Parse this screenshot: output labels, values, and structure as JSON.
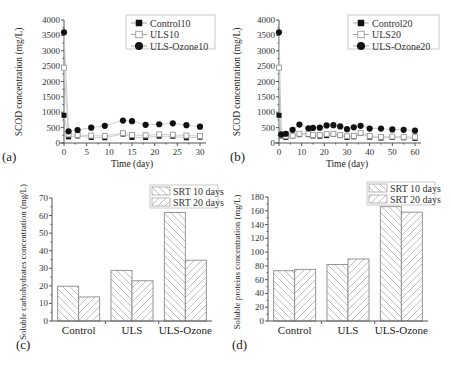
{
  "chart_data": [
    {
      "id": "a",
      "type": "line",
      "panel_label": "(a)",
      "title": "",
      "xlabel": "Time (day)",
      "ylabel": "SCOD concentration (mg/L)",
      "xlim": [
        0,
        30
      ],
      "ylim": [
        0,
        4000
      ],
      "xticks": [
        0,
        5,
        10,
        15,
        20,
        25,
        30
      ],
      "yticks": [
        0,
        500,
        1000,
        1500,
        2000,
        2500,
        3000,
        3500,
        4000
      ],
      "grid": false,
      "legend_position": "upper right",
      "x": [
        0,
        1,
        3,
        6,
        9,
        13,
        15,
        18,
        21,
        24,
        27,
        30
      ],
      "series": [
        {
          "name": "Control10",
          "marker": "filled-square",
          "values": [
            900,
            200,
            230,
            180,
            170,
            290,
            180,
            180,
            220,
            220,
            170,
            190
          ]
        },
        {
          "name": "ULS10",
          "marker": "open-square",
          "values": [
            2450,
            280,
            260,
            240,
            230,
            320,
            260,
            250,
            280,
            270,
            240,
            230
          ]
        },
        {
          "name": "ULS-Ozone10",
          "marker": "filled-circle",
          "values": [
            3600,
            380,
            420,
            500,
            560,
            730,
            710,
            590,
            610,
            640,
            580,
            530
          ]
        }
      ]
    },
    {
      "id": "b",
      "type": "line",
      "panel_label": "(b)",
      "title": "",
      "xlabel": "Time (day)",
      "ylabel": "SCOD concentration (mg/L)",
      "xlim": [
        0,
        60
      ],
      "ylim": [
        0,
        4000
      ],
      "xticks": [
        0,
        10,
        20,
        30,
        40,
        50,
        60
      ],
      "yticks": [
        0,
        500,
        1000,
        1500,
        2000,
        2500,
        3000,
        3500,
        4000
      ],
      "grid": false,
      "legend_position": "upper right",
      "x": [
        0,
        1,
        3,
        6,
        9,
        13,
        15,
        18,
        21,
        24,
        27,
        30,
        33,
        36,
        40,
        45,
        50,
        55,
        60
      ],
      "series": [
        {
          "name": "Control20",
          "marker": "filled-square",
          "values": [
            900,
            230,
            180,
            230,
            270,
            270,
            230,
            220,
            240,
            280,
            240,
            180,
            200,
            310,
            190,
            160,
            180,
            170,
            150
          ]
        },
        {
          "name": "ULS20",
          "marker": "open-square",
          "values": [
            2450,
            260,
            220,
            240,
            300,
            300,
            260,
            260,
            290,
            300,
            260,
            220,
            230,
            330,
            230,
            200,
            210,
            200,
            190
          ]
        },
        {
          "name": "ULS-Ozone20",
          "marker": "filled-circle",
          "values": [
            3600,
            280,
            300,
            430,
            600,
            480,
            490,
            500,
            570,
            580,
            540,
            450,
            510,
            560,
            470,
            470,
            440,
            430,
            400
          ]
        }
      ]
    },
    {
      "id": "c",
      "type": "bar",
      "panel_label": "(c)",
      "title": "",
      "xlabel": "",
      "ylabel": "Soluble carbohydrates concentration (mg/L)",
      "ylim": [
        0,
        70
      ],
      "yticks": [
        0,
        10,
        20,
        30,
        40,
        50,
        60,
        70
      ],
      "grid": false,
      "legend_position": "upper right",
      "categories": [
        "Control",
        "ULS",
        "ULS-Ozone"
      ],
      "series": [
        {
          "name": "SRT 10 days",
          "hatch": "backslash",
          "values": [
            19.8,
            28.8,
            61.8
          ]
        },
        {
          "name": "SRT 20 days",
          "hatch": "slash",
          "values": [
            13.7,
            22.9,
            34.6
          ]
        }
      ]
    },
    {
      "id": "d",
      "type": "bar",
      "panel_label": "(d)",
      "title": "",
      "xlabel": "",
      "ylabel": "Soluble proteins concentration (mg/L)",
      "ylim": [
        0,
        180
      ],
      "yticks": [
        0,
        20,
        40,
        60,
        80,
        100,
        120,
        140,
        160,
        180
      ],
      "grid": false,
      "legend_position": "upper right",
      "categories": [
        "Control",
        "ULS",
        "ULS-Ozone"
      ],
      "series": [
        {
          "name": "SRT 10 days",
          "hatch": "backslash",
          "values": [
            73,
            82,
            166
          ]
        },
        {
          "name": "SRT 20 days",
          "hatch": "slash",
          "values": [
            75,
            90,
            158
          ]
        }
      ]
    }
  ],
  "colors": {
    "marker_fill": "#111111",
    "line": "#bdbdbd",
    "bar_edge": "#8a8a8a",
    "hatch": "#b0b0b0",
    "axis": "#555555"
  }
}
